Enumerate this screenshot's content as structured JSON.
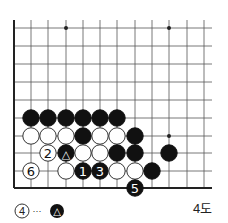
{
  "board": {
    "cols_x": [
      31,
      48,
      66,
      83,
      100,
      117,
      135,
      152,
      169,
      187,
      204
    ],
    "rows_y": [
      28,
      46,
      64,
      82,
      100,
      118,
      136,
      153,
      171
    ],
    "left_edge_x": 14,
    "bottom_edge_y": 188,
    "top_y": 20,
    "right_x": 212,
    "star_points": [
      [
        66,
        28
      ],
      [
        169,
        28
      ],
      [
        169,
        136
      ]
    ],
    "stones": [
      {
        "x": 31,
        "y": 118,
        "color": "black",
        "label": ""
      },
      {
        "x": 48,
        "y": 118,
        "color": "black",
        "label": ""
      },
      {
        "x": 66,
        "y": 118,
        "color": "black",
        "label": ""
      },
      {
        "x": 83,
        "y": 118,
        "color": "black",
        "label": ""
      },
      {
        "x": 100,
        "y": 118,
        "color": "black",
        "label": ""
      },
      {
        "x": 117,
        "y": 118,
        "color": "black",
        "label": ""
      },
      {
        "x": 31,
        "y": 136,
        "color": "white",
        "label": ""
      },
      {
        "x": 48,
        "y": 136,
        "color": "white",
        "label": ""
      },
      {
        "x": 66,
        "y": 136,
        "color": "white",
        "label": ""
      },
      {
        "x": 83,
        "y": 136,
        "color": "black",
        "label": ""
      },
      {
        "x": 100,
        "y": 136,
        "color": "white",
        "label": ""
      },
      {
        "x": 117,
        "y": 136,
        "color": "white",
        "label": ""
      },
      {
        "x": 135,
        "y": 136,
        "color": "black",
        "label": ""
      },
      {
        "x": 48,
        "y": 153,
        "color": "white",
        "label": "2"
      },
      {
        "x": 66,
        "y": 153,
        "color": "black",
        "label": "△"
      },
      {
        "x": 83,
        "y": 153,
        "color": "white",
        "label": ""
      },
      {
        "x": 100,
        "y": 153,
        "color": "white",
        "label": ""
      },
      {
        "x": 117,
        "y": 153,
        "color": "black",
        "label": ""
      },
      {
        "x": 135,
        "y": 153,
        "color": "black",
        "label": ""
      },
      {
        "x": 169,
        "y": 153,
        "color": "black",
        "label": ""
      },
      {
        "x": 31,
        "y": 171,
        "color": "white",
        "label": "6"
      },
      {
        "x": 66,
        "y": 171,
        "color": "white",
        "label": ""
      },
      {
        "x": 83,
        "y": 171,
        "color": "black",
        "label": "1"
      },
      {
        "x": 100,
        "y": 171,
        "color": "black",
        "label": "3"
      },
      {
        "x": 117,
        "y": 171,
        "color": "white",
        "label": ""
      },
      {
        "x": 135,
        "y": 171,
        "color": "white",
        "label": ""
      },
      {
        "x": 152,
        "y": 171,
        "color": "black",
        "label": ""
      },
      {
        "x": 135,
        "y": 188,
        "color": "black",
        "label": "5"
      }
    ]
  },
  "caption": {
    "note_stone": "4",
    "note_sep": "···",
    "note_target": "△",
    "figure_label": "4도"
  }
}
